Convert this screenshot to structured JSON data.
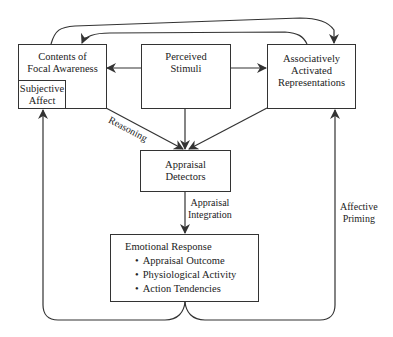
{
  "nodes": {
    "focal": {
      "line1": "Contents of",
      "line2": "Focal Awareness"
    },
    "subjective": {
      "line1": "Subjective",
      "line2": "Affect"
    },
    "stimuli": {
      "line1": "Perceived",
      "line2": "Stimuli"
    },
    "associative": {
      "line1": "Associatively",
      "line2": "Activated",
      "line3": "Representations"
    },
    "detectors": {
      "line1": "Appraisal",
      "line2": "Detectors"
    },
    "emotional": {
      "title": "Emotional Response",
      "items": [
        "Appraisal Outcome",
        "Physiological Activity",
        "Action Tendencies"
      ]
    }
  },
  "edge_labels": {
    "reasoning": "Reasoning",
    "integration_1": "Appraisal",
    "integration_2": "Integration",
    "priming_1": "Affective",
    "priming_2": "Priming"
  }
}
